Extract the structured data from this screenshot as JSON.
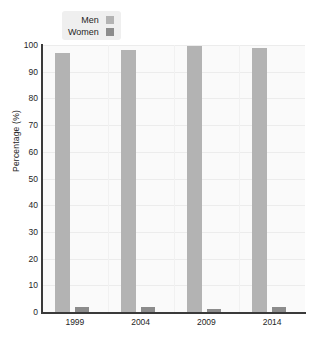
{
  "chart_data": {
    "type": "bar",
    "title": "",
    "xlabel": "",
    "ylabel": "Percentage (%)",
    "categories": [
      "1999",
      "2004",
      "2009",
      "2014"
    ],
    "series": [
      {
        "name": "Men",
        "values": [
          97,
          98,
          99.5,
          99
        ],
        "color": "#b3b3b3"
      },
      {
        "name": "Women",
        "values": [
          2,
          2,
          1,
          2
        ],
        "color": "#8c8c8c"
      }
    ],
    "ylim": [
      0,
      100
    ],
    "ytick_values": [
      0,
      10,
      20,
      30,
      40,
      50,
      60,
      70,
      80,
      90,
      100
    ],
    "ytick_labels": [
      "0",
      "10",
      "20",
      "30",
      "40",
      "50",
      "60",
      "70",
      "80",
      "90",
      "100"
    ],
    "grid": "horizontal",
    "legend_position": "top-left-inside"
  },
  "legend": {
    "entries": [
      {
        "label": "Men",
        "color": "#b3b3b3"
      },
      {
        "label": "Women",
        "color": "#8c8c8c"
      }
    ]
  },
  "colors": {
    "men": "#b3b3b3",
    "women": "#8c8c8c",
    "plot_background": "#fafafa",
    "gridline": "#ececec",
    "axis": "#3a3a3a",
    "legend_background": "#efefef",
    "text": "#262626"
  }
}
